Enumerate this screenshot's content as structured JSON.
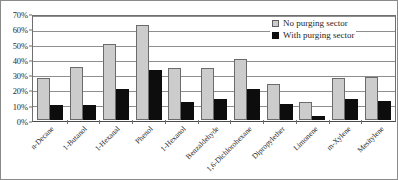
{
  "chart_data": {
    "type": "bar",
    "title": "",
    "xlabel": "",
    "ylabel": "",
    "ylim": [
      0,
      70
    ],
    "ytick_labels": [
      "0%",
      "10%",
      "20%",
      "30%",
      "40%",
      "50%",
      "60%",
      "70%"
    ],
    "ytick_values": [
      0,
      10,
      20,
      30,
      40,
      50,
      60,
      70
    ],
    "grid": true,
    "legend_position": "top-right",
    "categories": [
      "n-Decane",
      "1-Butanol",
      "1-Hexanal",
      "Phenol",
      "1-Hexanol",
      "Benzaldehyde",
      "1,6-Dichlorohexane",
      "Dipropylether",
      "Limonene",
      "m-Xylene",
      "Mesitylene"
    ],
    "series": [
      {
        "name": "No purging sector",
        "color": "#cccccc",
        "values": [
          28,
          36,
          51,
          64,
          35,
          35,
          41,
          24,
          12,
          28,
          29
        ]
      },
      {
        "name": "With purging sector",
        "color": "#0d0d0d",
        "values": [
          10,
          10,
          21,
          34,
          12,
          14,
          21,
          11,
          3,
          14,
          13
        ]
      }
    ]
  },
  "legend": {
    "items": [
      {
        "label": "No purging sector",
        "swatch": "light"
      },
      {
        "label": "With purging sector",
        "swatch": "dark"
      }
    ]
  }
}
